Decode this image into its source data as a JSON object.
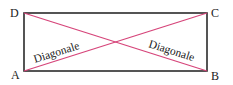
{
  "diagram": {
    "type": "rectangle-with-diagonals",
    "vertices": {
      "A": {
        "label": "A",
        "x": 24,
        "y": 71
      },
      "B": {
        "label": "B",
        "x": 207,
        "y": 71
      },
      "C": {
        "label": "C",
        "x": 207,
        "y": 13
      },
      "D": {
        "label": "D",
        "x": 24,
        "y": 13
      }
    },
    "diagonals": [
      {
        "from": "A",
        "to": "C",
        "label": "Diagonale"
      },
      {
        "from": "D",
        "to": "B",
        "label": "Diagonale"
      }
    ],
    "colors": {
      "rectangle": "#2b2b2b",
      "diagonal": "#d6457a",
      "text": "#222222"
    }
  }
}
